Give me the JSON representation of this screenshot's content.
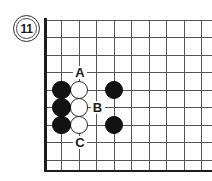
{
  "figure": {
    "kind": "go-board-diagram",
    "number_badge": {
      "label": "11",
      "icon": "circled-number-badge"
    },
    "board": {
      "columns": 9,
      "rows": 8,
      "cell_px": 17.5,
      "edges_shown": [
        "left",
        "bottom"
      ],
      "line_color": "#555555",
      "edge_color": "#1c1c1c",
      "background": "#ffffff"
    },
    "stones": [
      {
        "color": "black",
        "col": 1,
        "row": 4,
        "name": "black-stone-a1"
      },
      {
        "color": "black",
        "col": 1,
        "row": 5,
        "name": "black-stone-a2"
      },
      {
        "color": "black",
        "col": 1,
        "row": 6,
        "name": "black-stone-a3"
      },
      {
        "color": "white",
        "col": 2,
        "row": 4,
        "name": "white-stone-b1"
      },
      {
        "color": "white",
        "col": 2,
        "row": 5,
        "name": "white-stone-b2"
      },
      {
        "color": "white",
        "col": 2,
        "row": 6,
        "name": "white-stone-b3"
      },
      {
        "color": "black",
        "col": 4,
        "row": 4,
        "name": "black-stone-c1"
      },
      {
        "color": "black",
        "col": 4,
        "row": 6,
        "name": "black-stone-c2"
      }
    ],
    "labels": [
      {
        "text": "A",
        "col": 2,
        "row": 3,
        "name": "point-label-a"
      },
      {
        "text": "B",
        "col": 3,
        "row": 5,
        "name": "point-label-b"
      },
      {
        "text": "C",
        "col": 2,
        "row": 7,
        "name": "point-label-c"
      }
    ],
    "colors": {
      "black_stone": "#121212",
      "white_stone": "#ffffff",
      "stone_outline": "#2b2b2b",
      "grid": "#555555",
      "text": "#1a1a1a"
    }
  }
}
